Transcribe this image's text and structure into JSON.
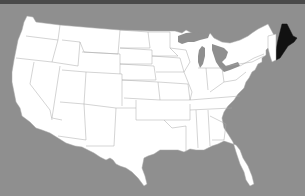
{
  "map": {
    "title": "",
    "region": "Contiguous United States",
    "highlighted_state": "Maine",
    "colors": {
      "background": "#8f8f8f",
      "land": "#ffffff",
      "borders": "#a8a8a8",
      "highlight": "#111111",
      "top_bar": "#4a4a4a"
    }
  }
}
